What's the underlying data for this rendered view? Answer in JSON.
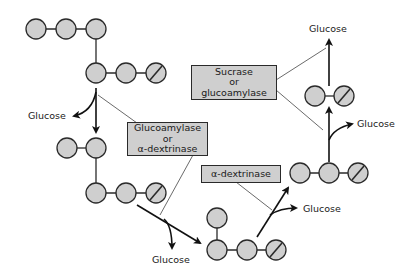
{
  "diagram": {
    "title": "",
    "colors": {
      "glucose_unit_fill": "#cfcfcf",
      "glucose_unit_stroke": "#2a2a2a",
      "enzyme_box_fill": "#cfcfcf",
      "arrow": "#111111",
      "leader_line": "#444444"
    },
    "enzymes": [
      {
        "id": "glucoamylase-or-a-dextrinase",
        "lines": [
          "Glucoamylase",
          "or",
          "α-dextrinase"
        ]
      },
      {
        "id": "sucrase-or-glucoamylase",
        "lines": [
          "Sucrase",
          "or",
          "glucoamylase"
        ]
      },
      {
        "id": "a-dextrinase",
        "lines": [
          "α-dextrinase"
        ]
      }
    ],
    "products": [
      {
        "id": "glucose-1",
        "label": "Glucose"
      },
      {
        "id": "glucose-2",
        "label": "Glucose"
      },
      {
        "id": "glucose-3",
        "label": "Glucose"
      },
      {
        "id": "glucose-4",
        "label": "Glucose"
      }
    ],
    "molecules": [
      {
        "id": "branched-oligosaccharide-1",
        "units": 6,
        "reducing_end_units": 1
      },
      {
        "id": "branched-oligosaccharide-2",
        "units": 5,
        "reducing_end_units": 1
      },
      {
        "id": "branched-oligosaccharide-3",
        "units": 4,
        "reducing_end_units": 1
      },
      {
        "id": "trisaccharide",
        "units": 3,
        "reducing_end_units": 1
      },
      {
        "id": "disaccharide",
        "units": 2,
        "reducing_end_units": 1
      }
    ],
    "legend_note": "Gray circles = glucose units; slashed circle = reducing-end unit"
  }
}
